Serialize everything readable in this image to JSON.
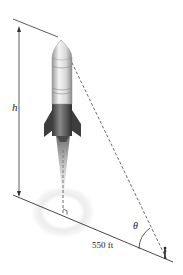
{
  "figure": {
    "labels": {
      "height": "h",
      "angle": "θ",
      "distance": "550 ft"
    },
    "colors": {
      "line": "#333333",
      "dashed": "#444444",
      "rocket_light": "#e6e6e6",
      "rocket_dark": "#555555",
      "glow": "#ececec"
    }
  }
}
